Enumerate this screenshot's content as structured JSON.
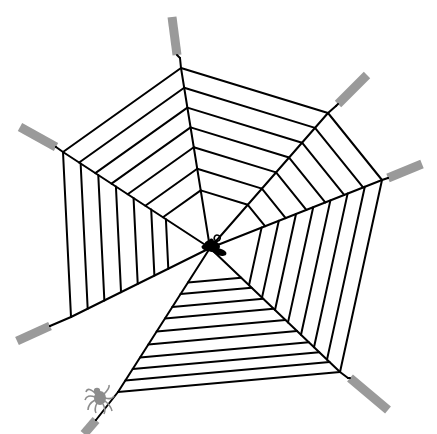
{
  "scene": {
    "title": "Spider web illustration",
    "background": "#ffffff",
    "line_color": "#000000",
    "anchor_color": "#9a9a9a",
    "spider_color": "#8c8c8c",
    "fly_color": "#000000"
  },
  "web": {
    "center": [
      210,
      248
    ],
    "spokes": [
      {
        "name": "top",
        "outer": [
          181,
          68
        ],
        "tail": [
          180,
          58
        ],
        "anchor": [
          [
            177,
            55
          ],
          [
            172,
            17
          ]
        ]
      },
      {
        "name": "upper-right",
        "outer": [
          328,
          113
        ],
        "tail": [
          336,
          106
        ],
        "anchor": [
          [
            338,
            104
          ],
          [
            367,
            75
          ]
        ]
      },
      {
        "name": "right",
        "outer": [
          382,
          180
        ],
        "tail": [
          388,
          178
        ],
        "anchor": [
          [
            388,
            178
          ],
          [
            422,
            164
          ]
        ]
      },
      {
        "name": "lower-right",
        "outer": [
          340,
          372
        ],
        "tail": [
          348,
          378
        ],
        "anchor": [
          [
            350,
            378
          ],
          [
            388,
            410
          ]
        ]
      },
      {
        "name": "bottom-left",
        "outer": [
          118,
          392
        ],
        "tail": [
          96,
          420
        ],
        "anchor": [
          [
            96,
            420
          ],
          [
            84,
            434
          ]
        ]
      },
      {
        "name": "left",
        "outer": [
          71,
          317
        ],
        "tail": [
          50,
          326
        ],
        "anchor": [
          [
            50,
            326
          ],
          [
            17,
            341
          ]
        ]
      },
      {
        "name": "upper-left",
        "outer": [
          63,
          152
        ],
        "tail": [
          56,
          147
        ],
        "anchor": [
          [
            56,
            147
          ],
          [
            20,
            127
          ]
        ]
      }
    ],
    "wedges": [
      {
        "from": 6,
        "to": 0,
        "rings": [
          1.0,
          0.89,
          0.78,
          0.67,
          0.56,
          0.44,
          0.32
        ]
      },
      {
        "from": 0,
        "to": 1,
        "rings": [
          1.0,
          0.89,
          0.78,
          0.67,
          0.56,
          0.44,
          0.32
        ]
      },
      {
        "from": 1,
        "to": 2,
        "rings": [
          1.0,
          0.89,
          0.78,
          0.67,
          0.56,
          0.44,
          0.32
        ]
      },
      {
        "from": 2,
        "to": 3,
        "rings": [
          1.0,
          0.9,
          0.8,
          0.7,
          0.6,
          0.5,
          0.4,
          0.3
        ]
      },
      {
        "from": 3,
        "to": 4,
        "rings": [
          1.0,
          0.92,
          0.84,
          0.76,
          0.67,
          0.58,
          0.49,
          0.41,
          0.32,
          0.24
        ]
      },
      {
        "from": 5,
        "to": 6,
        "rings": [
          1.0,
          0.88,
          0.76,
          0.64,
          0.52,
          0.4,
          0.3
        ]
      }
    ]
  },
  "fly": {
    "position": [
      212,
      246
    ],
    "label": "fly"
  },
  "spider": {
    "position": [
      100,
      398
    ],
    "label": "spider"
  }
}
